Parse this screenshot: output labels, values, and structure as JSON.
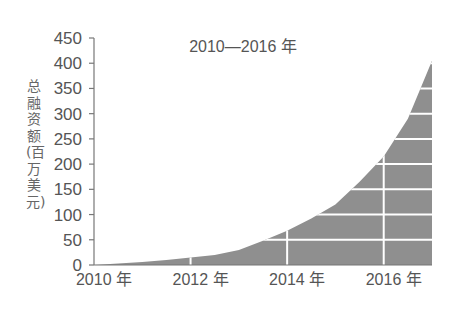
{
  "chart_data": {
    "type": "area",
    "title": "2010—2016 年",
    "xlabel": "",
    "ylabel": "总融资额(百万美元)",
    "x": [
      2010,
      2010.5,
      2011,
      2011.5,
      2012,
      2012.5,
      2013,
      2013.5,
      2014,
      2014.5,
      2015,
      2015.5,
      2016,
      2016.5,
      2017
    ],
    "values": [
      0,
      3,
      6,
      10,
      15,
      20,
      30,
      48,
      68,
      92,
      120,
      165,
      215,
      290,
      405
    ],
    "series": [
      {
        "name": "总融资额",
        "values": [
          0,
          3,
          6,
          10,
          15,
          20,
          30,
          48,
          68,
          92,
          120,
          165,
          215,
          290,
          405
        ]
      }
    ],
    "xtick_labels": [
      "2010 年",
      "2012 年",
      "2014 年",
      "2016 年"
    ],
    "xtick_values": [
      2010,
      2012,
      2014,
      2016
    ],
    "ytick_labels": [
      "0",
      "50",
      "100",
      "150",
      "200",
      "250",
      "300",
      "350",
      "400",
      "450"
    ],
    "ytick_values": [
      0,
      50,
      100,
      150,
      200,
      250,
      300,
      350,
      400,
      450
    ],
    "ylim": [
      0,
      450
    ],
    "xlim": [
      2010,
      2017
    ],
    "grid": true,
    "grid_style": "white lines drawn over the filled area only",
    "legend": "none",
    "fill_color": "#8f8f8f"
  }
}
